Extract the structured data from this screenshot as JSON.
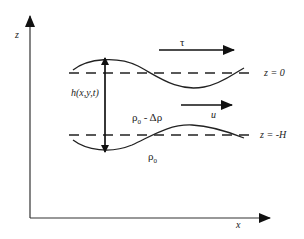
{
  "diagram": {
    "axes": {
      "vertical_label": "z",
      "horizontal_label": "x"
    },
    "interfaces": {
      "top_label": "z = 0",
      "bottom_label": "z = -H"
    },
    "arrows": {
      "wind_stress_label": "τ",
      "velocity_label": "u",
      "thickness_label": "h(x,y,t)"
    },
    "layers": {
      "upper_density_label": "ρ0 - Δρ",
      "lower_density_label": "ρ0"
    }
  }
}
